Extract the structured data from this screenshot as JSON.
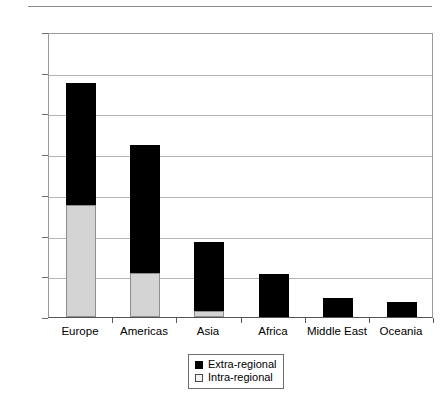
{
  "chart_data": {
    "type": "bar",
    "stacked": true,
    "title": "",
    "xlabel": "",
    "ylabel": "",
    "ylim": [
      0,
      3500
    ],
    "ytick_step": 500,
    "grid": true,
    "legend_position": "bottom-center",
    "categories": [
      "Europe",
      "Americas",
      "Asia",
      "Africa",
      "Middle East",
      "Oceania"
    ],
    "ytick_labels": [
      "3,500",
      "3,000",
      "2,500",
      "2,000",
      "1,500",
      "1,000",
      "500",
      "0"
    ],
    "ytick_values": [
      3500,
      3000,
      2500,
      2000,
      1500,
      1000,
      500,
      0
    ],
    "series": [
      {
        "name": "Intra-regional",
        "color": "#d4d4d4",
        "values": [
          1380,
          540,
          70,
          0,
          0,
          0
        ]
      },
      {
        "name": "Extra-regional",
        "color": "#000000",
        "values": [
          1500,
          1570,
          850,
          530,
          235,
          185
        ]
      }
    ],
    "totals": [
      2880,
      2110,
      920,
      530,
      235,
      185
    ]
  },
  "legend": {
    "items": [
      {
        "label": "Extra-regional",
        "swatch": "black-square-icon"
      },
      {
        "label": "Intra-regional",
        "swatch": "white-square-icon"
      }
    ]
  },
  "header": {
    "title_fragment": ""
  }
}
